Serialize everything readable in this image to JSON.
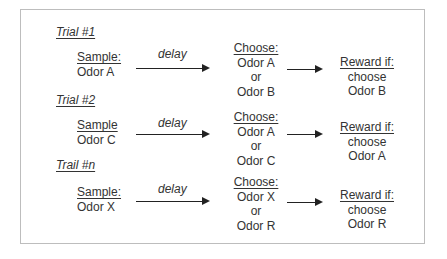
{
  "trials": [
    {
      "label": "Trial #1",
      "sample_head": "Sample:",
      "sample_odor": "Odor A",
      "delay": "delay",
      "choose_head": "Choose:",
      "choose_option1": "Odor A",
      "choose_or": "or",
      "choose_option2": "Odor B",
      "reward_head": "Reward if:",
      "reward_line1": "choose",
      "reward_line2": "Odor B"
    },
    {
      "label": "Trial #2",
      "sample_head": "Sample",
      "sample_odor": "Odor C",
      "delay": "delay",
      "choose_head": "Choose:",
      "choose_option1": "Odor A",
      "choose_or": "or",
      "choose_option2": "Odor C",
      "reward_head": "Reward if:",
      "reward_line1": "choose",
      "reward_line2": "Odor A"
    },
    {
      "label": "Trail #n",
      "sample_head": "Sample:",
      "sample_odor": "Odor X",
      "delay": "delay",
      "choose_head": "Choose:",
      "choose_option1": "Odor X",
      "choose_or": "or",
      "choose_option2": "Odor R",
      "reward_head": "Reward if:",
      "reward_line1": "choose",
      "reward_line2": "Odor R"
    }
  ]
}
